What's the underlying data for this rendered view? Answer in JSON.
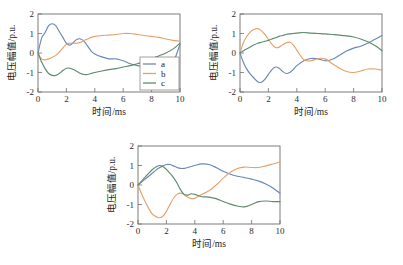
{
  "figure": {
    "background": "#ffffff",
    "panels": [
      "a",
      "b",
      "c"
    ]
  },
  "colors": {
    "series_a": "#6a87b8",
    "series_b": "#e8a06a",
    "series_c": "#5d8b6e",
    "axis": "#6e6e6e",
    "text": "#1a1a1a"
  },
  "axis_titles": {
    "x": "时间/ms",
    "y": "电压幅值/p.u."
  },
  "ticks": {
    "x": [
      "0",
      "2",
      "4",
      "6",
      "8",
      "10"
    ],
    "y": [
      "2",
      "1",
      "0",
      "-1",
      "-2"
    ]
  },
  "legend": {
    "items": [
      {
        "label": "a",
        "color": "#6a87b8"
      },
      {
        "label": "b",
        "color": "#e8a06a"
      },
      {
        "label": "c",
        "color": "#5d8b6e"
      }
    ]
  },
  "chart_data": [
    {
      "type": "line",
      "id": "panel-a",
      "title": "",
      "xlabel": "时间/ms",
      "ylabel": "电压幅值/p.u.",
      "xlim": [
        0,
        10
      ],
      "ylim": [
        -2,
        2
      ],
      "xticks": [
        0,
        2,
        4,
        6,
        8,
        10
      ],
      "yticks": [
        -2,
        -1,
        0,
        1,
        2
      ],
      "grid": false,
      "legend_position": "lower-right",
      "x": [
        0,
        0.25,
        0.5,
        0.75,
        1.0,
        1.25,
        1.5,
        1.75,
        2.0,
        2.25,
        2.5,
        2.75,
        3.0,
        3.25,
        3.5,
        3.75,
        4.0,
        4.5,
        5.0,
        5.5,
        6.0,
        6.5,
        7.0,
        7.5,
        8.0,
        8.5,
        9.0,
        9.5,
        10.0
      ],
      "series": [
        {
          "name": "a",
          "color": "#6a87b8",
          "values": [
            0.0,
            0.75,
            1.05,
            1.4,
            1.5,
            1.4,
            1.1,
            0.8,
            0.5,
            0.4,
            0.55,
            0.7,
            0.72,
            0.6,
            0.35,
            0.1,
            -0.05,
            -0.2,
            -0.3,
            -0.3,
            -0.4,
            -0.55,
            -0.65,
            -0.7,
            -0.72,
            -0.7,
            -0.6,
            -0.5,
            0.45
          ]
        },
        {
          "name": "b",
          "color": "#e8a06a",
          "values": [
            0.0,
            -0.3,
            -0.35,
            -0.3,
            -0.22,
            -0.12,
            0.05,
            0.25,
            0.45,
            0.5,
            0.5,
            0.5,
            0.55,
            0.65,
            0.72,
            0.8,
            0.85,
            0.9,
            0.92,
            0.95,
            1.0,
            1.0,
            0.95,
            0.9,
            0.85,
            0.8,
            0.72,
            0.65,
            0.6
          ]
        },
        {
          "name": "c",
          "color": "#5d8b6e",
          "values": [
            0.0,
            -0.45,
            -0.8,
            -1.05,
            -1.15,
            -1.15,
            -1.05,
            -0.9,
            -0.78,
            -0.78,
            -0.85,
            -0.95,
            -1.05,
            -1.1,
            -1.1,
            -1.05,
            -1.0,
            -0.92,
            -0.85,
            -0.8,
            -0.72,
            -0.65,
            -0.55,
            -0.45,
            -0.3,
            -0.15,
            0.0,
            0.2,
            0.5
          ]
        }
      ]
    },
    {
      "type": "line",
      "id": "panel-b",
      "title": "",
      "xlabel": "时间/ms",
      "ylabel": "电压幅值/p.u.",
      "xlim": [
        0,
        10
      ],
      "ylim": [
        -2,
        2
      ],
      "xticks": [
        0,
        2,
        4,
        6,
        8,
        10
      ],
      "yticks": [
        -2,
        -1,
        0,
        1,
        2
      ],
      "grid": false,
      "legend_position": "none",
      "x": [
        0,
        0.25,
        0.5,
        0.75,
        1.0,
        1.25,
        1.5,
        1.75,
        2.0,
        2.25,
        2.5,
        2.75,
        3.0,
        3.25,
        3.5,
        3.75,
        4.0,
        4.5,
        5.0,
        5.5,
        6.0,
        6.5,
        7.0,
        7.5,
        8.0,
        8.5,
        9.0,
        9.5,
        10.0
      ],
      "series": [
        {
          "name": "a",
          "color": "#6a87b8",
          "values": [
            0.0,
            -0.5,
            -0.85,
            -1.1,
            -1.3,
            -1.48,
            -1.5,
            -1.35,
            -1.1,
            -0.85,
            -0.72,
            -0.78,
            -0.95,
            -1.05,
            -1.0,
            -0.85,
            -0.65,
            -0.4,
            -0.28,
            -0.3,
            -0.4,
            -0.32,
            -0.12,
            0.1,
            0.25,
            0.35,
            0.5,
            0.7,
            0.9
          ]
        },
        {
          "name": "b",
          "color": "#e8a06a",
          "values": [
            0.0,
            0.55,
            0.88,
            1.1,
            1.22,
            1.25,
            1.15,
            0.95,
            0.7,
            0.45,
            0.28,
            0.3,
            0.42,
            0.52,
            0.55,
            0.42,
            0.15,
            -0.35,
            -0.4,
            -0.28,
            -0.3,
            -0.55,
            -0.78,
            -0.95,
            -1.0,
            -0.92,
            -0.82,
            -0.82,
            -0.88
          ]
        },
        {
          "name": "c",
          "color": "#5d8b6e",
          "values": [
            0.0,
            0.12,
            0.22,
            0.32,
            0.42,
            0.5,
            0.55,
            0.6,
            0.65,
            0.72,
            0.78,
            0.85,
            0.9,
            0.95,
            0.98,
            1.0,
            1.02,
            1.05,
            1.02,
            1.0,
            0.98,
            0.95,
            0.92,
            0.88,
            0.82,
            0.72,
            0.58,
            0.38,
            0.12
          ]
        }
      ]
    },
    {
      "type": "line",
      "id": "panel-c",
      "title": "",
      "xlabel": "时间/ms",
      "ylabel": "电压幅值/p.u.",
      "xlim": [
        0,
        10
      ],
      "ylim": [
        -2,
        2
      ],
      "xticks": [
        0,
        2,
        4,
        6,
        8,
        10
      ],
      "yticks": [
        -2,
        -1,
        0,
        1,
        2
      ],
      "grid": false,
      "legend_position": "none",
      "x": [
        0,
        0.25,
        0.5,
        0.75,
        1.0,
        1.25,
        1.5,
        1.75,
        2.0,
        2.25,
        2.5,
        2.75,
        3.0,
        3.25,
        3.5,
        3.75,
        4.0,
        4.5,
        5.0,
        5.5,
        6.0,
        6.5,
        7.0,
        7.5,
        8.0,
        8.5,
        9.0,
        9.5,
        10.0
      ],
      "series": [
        {
          "name": "a",
          "color": "#6a87b8",
          "values": [
            0.0,
            0.15,
            0.3,
            0.45,
            0.6,
            0.75,
            0.88,
            0.98,
            1.05,
            1.05,
            0.98,
            0.9,
            0.85,
            0.85,
            0.9,
            0.95,
            1.0,
            1.08,
            1.05,
            0.9,
            0.7,
            0.55,
            0.45,
            0.38,
            0.3,
            0.2,
            0.05,
            -0.15,
            -0.42
          ]
        },
        {
          "name": "b",
          "color": "#e8a06a",
          "values": [
            0.0,
            -0.45,
            -0.85,
            -1.2,
            -1.48,
            -1.62,
            -1.68,
            -1.6,
            -1.35,
            -1.0,
            -0.68,
            -0.48,
            -0.42,
            -0.5,
            -0.62,
            -0.7,
            -0.68,
            -0.48,
            -0.3,
            0.0,
            0.35,
            0.65,
            0.85,
            0.92,
            0.9,
            0.9,
            0.98,
            1.08,
            1.18
          ]
        },
        {
          "name": "c",
          "color": "#5d8b6e",
          "values": [
            0.0,
            0.2,
            0.4,
            0.6,
            0.78,
            0.92,
            1.0,
            0.95,
            0.8,
            0.6,
            0.38,
            0.1,
            -0.25,
            -0.48,
            -0.52,
            -0.45,
            -0.48,
            -0.6,
            -0.62,
            -0.7,
            -0.85,
            -0.98,
            -1.08,
            -1.12,
            -1.0,
            -0.85,
            -0.82,
            -0.85,
            -0.85
          ]
        }
      ]
    }
  ]
}
